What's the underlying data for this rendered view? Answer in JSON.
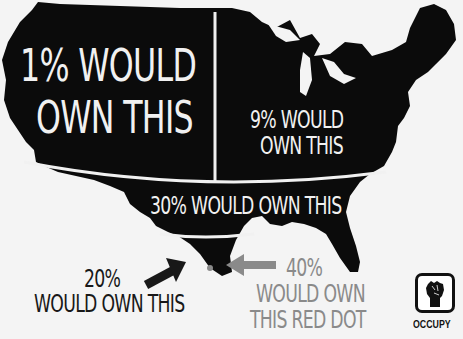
{
  "poster": {
    "subject": "Map of the contiguous United States divided into wealth-ownership regions",
    "colors": {
      "background": "#f4f4f4",
      "map_fill": "#0b0b0b",
      "divider_lines": "#f1f1f1",
      "label_white": "#f1f1f1",
      "label_dark": "#181818",
      "label_gray": "#8a8a8a",
      "dot": "#8a8a8a"
    },
    "regions": [
      {
        "id": "west",
        "line1": "1% WOULD",
        "line2": "OWN THIS"
      },
      {
        "id": "northeast",
        "line1": "9% WOULD",
        "line2": "OWN THIS"
      },
      {
        "id": "south_band",
        "line1": "30% WOULD OWN THIS"
      },
      {
        "id": "texas_tip",
        "line1": "20%",
        "line2": "WOULD OWN THIS"
      },
      {
        "id": "red_dot",
        "line1": "40%",
        "line2": "WOULD OWN",
        "line3": "THIS RED DOT"
      }
    ],
    "logo": {
      "icon": "raised-fist-icon",
      "label": "OCCUPY"
    }
  }
}
